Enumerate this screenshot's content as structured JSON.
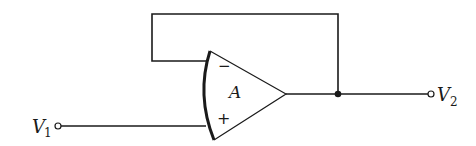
{
  "diagram": {
    "type": "op-amp voltage follower (unity-gain buffer)",
    "amplifier": {
      "gain_label": "A",
      "inverting_sign": "−",
      "noninverting_sign": "+"
    },
    "input": {
      "label": "V",
      "subscript": "1"
    },
    "output": {
      "label": "V",
      "subscript": "2"
    },
    "colors": {
      "line": "#1a1a1a",
      "background": "#ffffff"
    }
  }
}
